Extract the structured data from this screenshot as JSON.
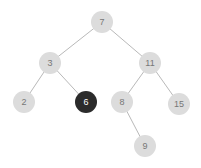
{
  "diagram": {
    "type": "binary-tree",
    "width": 201,
    "height": 168,
    "background_color": "#ffffff",
    "node_radius": 11,
    "node_fill_default": "#dcdcdc",
    "node_text_default": "#777777",
    "node_fill_highlight": "#2b2b2b",
    "node_text_highlight": "#ffffff",
    "edge_color": "#b9b9b9",
    "edge_width": 1,
    "font_size": 9
  },
  "nodes": [
    {
      "id": "n7",
      "label": "7",
      "x": 102,
      "y": 22,
      "highlighted": false
    },
    {
      "id": "n3",
      "label": "3",
      "x": 50,
      "y": 63,
      "highlighted": false
    },
    {
      "id": "n11",
      "label": "11",
      "x": 150,
      "y": 63,
      "highlighted": false
    },
    {
      "id": "n2",
      "label": "2",
      "x": 24,
      "y": 102,
      "highlighted": false
    },
    {
      "id": "n6",
      "label": "6",
      "x": 86,
      "y": 102,
      "highlighted": true
    },
    {
      "id": "n8",
      "label": "8",
      "x": 122,
      "y": 102,
      "highlighted": false
    },
    {
      "id": "n15",
      "label": "15",
      "x": 179,
      "y": 104,
      "highlighted": false
    },
    {
      "id": "n9",
      "label": "9",
      "x": 145,
      "y": 146,
      "highlighted": false
    }
  ],
  "edges": [
    {
      "id": "e7-3",
      "from": "n7",
      "to": "n3"
    },
    {
      "id": "e7-11",
      "from": "n7",
      "to": "n11"
    },
    {
      "id": "e3-2",
      "from": "n3",
      "to": "n2"
    },
    {
      "id": "e3-6",
      "from": "n3",
      "to": "n6"
    },
    {
      "id": "e11-8",
      "from": "n11",
      "to": "n8"
    },
    {
      "id": "e11-15",
      "from": "n11",
      "to": "n15"
    },
    {
      "id": "e8-9",
      "from": "n8",
      "to": "n9"
    }
  ]
}
